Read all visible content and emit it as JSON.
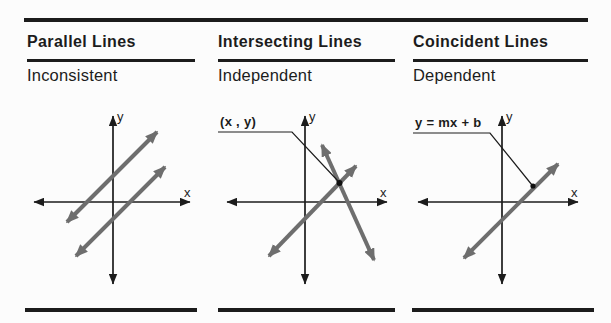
{
  "figure": {
    "columns": [
      {
        "title": "Parallel Lines",
        "subtitle": "Inconsistent"
      },
      {
        "title": "Intersecting Lines",
        "subtitle": "Independent",
        "callout": "(x , y)"
      },
      {
        "title": "Coincident Lines",
        "subtitle": "Dependent",
        "callout": "y = mx + b"
      }
    ],
    "axis": {
      "x": "x",
      "y": "y"
    },
    "colors": {
      "ink": "#1c1c1c",
      "gray_line": "#6e6e6e",
      "background": "#fcfcfc"
    }
  }
}
